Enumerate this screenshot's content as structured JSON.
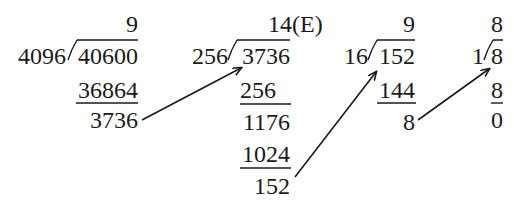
{
  "steps": [
    {
      "divisor": "4096",
      "dividend": "40600",
      "quotient": "9",
      "product": "36864",
      "remainder": "3736"
    },
    {
      "divisor": "256",
      "dividend": "3736",
      "quotient": "14(E)",
      "product1": "256",
      "partial": "1176",
      "product2": "1024",
      "remainder": "152"
    },
    {
      "divisor": "16",
      "dividend": "152",
      "quotient": "9",
      "product": "144",
      "remainder": "8"
    },
    {
      "divisor": "1",
      "dividend": "8",
      "quotient": "8",
      "product": "8",
      "remainder": "0"
    }
  ],
  "colors": {
    "ink": "#1a1a1a",
    "background": "#ffffff"
  }
}
